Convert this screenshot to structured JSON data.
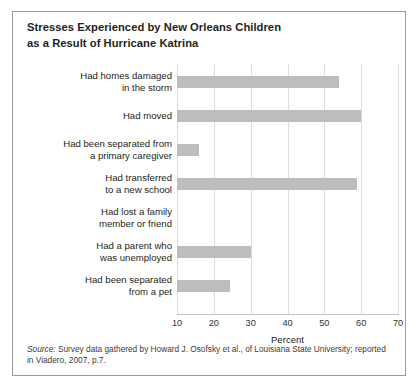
{
  "top_bleed_text": "",
  "title": {
    "line1": "Stresses Experienced by New Orleans Children",
    "line2": "as a Result of Hurricane Katrina"
  },
  "source": {
    "label": "Source:",
    "text": " Survey data gathered by Howard J. Osofsky et al., of Louisiana State University; reported in Viadero, 2007, p.7."
  },
  "colors": {
    "bar_fill": "#bdbdbd",
    "gridline": "#dcdcdc",
    "axis": "#4a4a4a",
    "frame_border": "#9a9a9a",
    "text": "#231f20",
    "background": "#ffffff"
  },
  "chart_data": {
    "type": "bar",
    "orientation": "horizontal",
    "title": "Stresses Experienced by New Orleans Children as a Result of Hurricane Katrina",
    "xlabel": "Percent",
    "ylabel": "",
    "xlim": [
      0,
      72
    ],
    "xticks": [
      10,
      20,
      30,
      40,
      50,
      60,
      70
    ],
    "xticklabels": [
      "10",
      "20",
      "30",
      "40",
      "50",
      "60",
      "70"
    ],
    "grid": "vertical",
    "legend": "none",
    "categories": [
      "Had homes damaged in the storm",
      "Had moved",
      "Had been separated from a primary caregiver",
      "Had transferred to a new school",
      "Had lost a family member or friend",
      "Had a parent who was unemployed",
      "Had been separated from a pet"
    ],
    "category_lines": [
      [
        "Had homes damaged",
        "in the storm"
      ],
      [
        "Had moved"
      ],
      [
        "Had been separated from",
        "a primary caregiver"
      ],
      [
        "Had transferred",
        "to a new school"
      ],
      [
        "Had lost a family",
        "member or friend"
      ],
      [
        "Had a parent who",
        "was unemployed"
      ],
      [
        "Had been separated",
        "from a pet"
      ]
    ],
    "values": [
      64,
      70,
      26,
      69,
      13,
      40,
      34.5
    ]
  }
}
